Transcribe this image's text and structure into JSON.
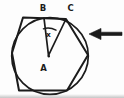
{
  "diagram": {
    "kind": "geometry-figure",
    "description_visible_elements": "hexagon with inscribed circle, two radii from center forming angle, left-pointing arrow marker",
    "labels": {
      "center_point": "A",
      "top_tangent_point": "B",
      "top_right_vertex": "C",
      "angle": "x"
    },
    "colors": {
      "ink": "#1b1b1b",
      "background": "#fdfdfd"
    }
  }
}
